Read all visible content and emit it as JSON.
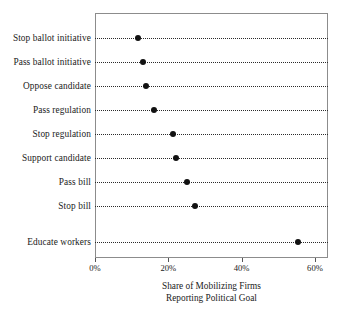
{
  "chart_data": {
    "type": "scatter",
    "subtype": "dot-plot",
    "title": "",
    "xlabel": "Share of Mobilizing Firms Reporting Political Goal",
    "xlabel_lines": [
      "Share of Mobilizing Firms",
      "Reporting Political Goal"
    ],
    "ylabel": "",
    "categories": [
      "Stop ballot initiative",
      "Pass ballot initiative",
      "Oppose candidate",
      "Pass regulation",
      "Stop regulation",
      "Support candidate",
      "Pass bill",
      "Stop bill",
      "Educate workers"
    ],
    "values": [
      11.7,
      13.1,
      13.9,
      16.1,
      21.3,
      22.0,
      25.0,
      27.2,
      55.3
    ],
    "value_unit": "percent",
    "xlim": [
      -4,
      59.5
    ],
    "xticks": [
      0,
      20,
      40,
      60
    ],
    "xtick_labels": [
      "0%",
      "20%",
      "40%",
      "60%"
    ],
    "grid": "dotted-horizontal-rows",
    "legend": "none",
    "marker_color": "#111111",
    "frame_color": "#8c8c8c"
  },
  "axis": {
    "x_title_line1": "Share of Mobilizing Firms",
    "x_title_line2": "Reporting Political Goal"
  }
}
